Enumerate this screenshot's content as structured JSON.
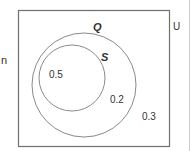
{
  "diagram": {
    "type": "venn",
    "sets": [
      {
        "name": "Q",
        "label": "Q"
      },
      {
        "name": "S",
        "label": "S"
      }
    ],
    "regions": [
      {
        "region": "S",
        "value": "0.5"
      },
      {
        "region": "Q only",
        "value": "0.2"
      },
      {
        "region": "outside Q",
        "value": "0.3"
      }
    ]
  },
  "side_text": {
    "left_fragment": "n",
    "right_fragment": "U"
  },
  "colors": {
    "border": "#6f6f6f",
    "circle": "#8a8a8a",
    "text": "#333333"
  }
}
